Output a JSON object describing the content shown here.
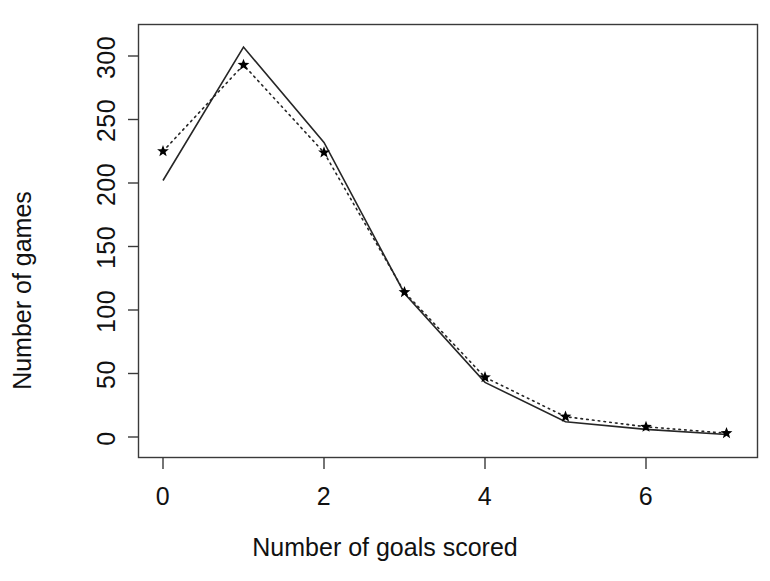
{
  "chart_data": {
    "type": "line",
    "title": "",
    "subtitle": "",
    "xlabel": "Number of goals scored",
    "ylabel": "Number of games",
    "x": [
      0,
      1,
      2,
      3,
      4,
      5,
      6,
      7
    ],
    "series": [
      {
        "name": "observed",
        "style": "solid-line",
        "marker": "none",
        "values": [
          202,
          307,
          232,
          113,
          43,
          12,
          6,
          2
        ]
      },
      {
        "name": "fitted",
        "style": "dotted-line",
        "marker": "star",
        "values": [
          225,
          293,
          224,
          114,
          47,
          16,
          8,
          3
        ]
      }
    ],
    "xlim": [
      -0.3,
      7.3
    ],
    "ylim": [
      -8,
      318
    ],
    "xticks": [
      0,
      2,
      4,
      6
    ],
    "xtick_labels": [
      "0",
      "2",
      "4",
      "6"
    ],
    "yticks": [
      0,
      50,
      100,
      150,
      200,
      250,
      300
    ],
    "ytick_labels": [
      "0",
      "50",
      "100",
      "150",
      "200",
      "250",
      "300"
    ],
    "grid": false,
    "legend": "none",
    "frame": "box",
    "colors": {
      "line": "#1a1a1a",
      "marker": "#000000",
      "axis": "#333333",
      "background": "#ffffff"
    }
  },
  "axes": {
    "x_title": "Number of goals scored",
    "y_title": "Number of games"
  }
}
